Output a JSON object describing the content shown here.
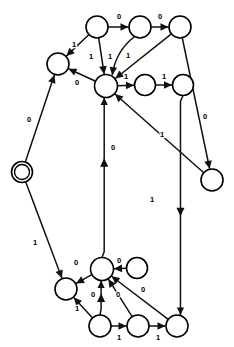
{
  "diagram": {
    "width": 234,
    "height": 347,
    "background_color": "#ffffff",
    "stroke_color": "#111111",
    "label_color": "#000000",
    "node_fill": "#ffffff",
    "nodes": [
      {
        "id": "n0",
        "name": "start-accept-state",
        "cx": 22,
        "cy": 172,
        "r": 10.5,
        "double": true
      },
      {
        "id": "n1",
        "name": "state-upper-left",
        "cx": 58,
        "cy": 64,
        "r": 11,
        "double": false
      },
      {
        "id": "n2",
        "name": "state-top-a",
        "cx": 97,
        "cy": 27,
        "r": 11,
        "double": false
      },
      {
        "id": "n3",
        "name": "state-top-b",
        "cx": 140,
        "cy": 27,
        "r": 11,
        "double": false
      },
      {
        "id": "n4",
        "name": "state-top-c",
        "cx": 180,
        "cy": 27,
        "r": 11,
        "double": false
      },
      {
        "id": "n5",
        "name": "state-hub",
        "cx": 106,
        "cy": 86,
        "r": 11.5,
        "double": false
      },
      {
        "id": "n6",
        "name": "state-mid-right-a",
        "cx": 145,
        "cy": 85,
        "r": 10.5,
        "double": false
      },
      {
        "id": "n7",
        "name": "state-mid-right-b",
        "cx": 183,
        "cy": 85,
        "r": 10.5,
        "double": false
      },
      {
        "id": "n8",
        "name": "state-right-low",
        "cx": 212,
        "cy": 180,
        "r": 11,
        "double": false
      },
      {
        "id": "n9",
        "name": "state-lower-left",
        "cx": 66,
        "cy": 289,
        "r": 11,
        "double": false
      },
      {
        "id": "n10",
        "name": "state-lower-hub",
        "cx": 102,
        "cy": 269,
        "r": 11.5,
        "double": false
      },
      {
        "id": "n11",
        "name": "state-lower-top-r",
        "cx": 137,
        "cy": 268,
        "r": 10.5,
        "double": false
      },
      {
        "id": "n12",
        "name": "state-bottom-a",
        "cx": 100,
        "cy": 326,
        "r": 11,
        "double": false
      },
      {
        "id": "n13",
        "name": "state-bottom-b",
        "cx": 138,
        "cy": 326,
        "r": 11,
        "double": false
      },
      {
        "id": "n14",
        "name": "state-bottom-c",
        "cx": 177,
        "cy": 326,
        "r": 11,
        "double": false
      }
    ],
    "edges": [
      {
        "name": "edge-start-to-upper-left",
        "from": "n0",
        "to": "n1",
        "label": "0",
        "lx": 29,
        "ly": 120,
        "kind": "straight"
      },
      {
        "name": "edge-upper-left-to-top-a-rev",
        "from": "n2",
        "to": "n1",
        "label": "1",
        "lx": 74,
        "ly": 45,
        "kind": "straight"
      },
      {
        "name": "edge-hub-to-upper-left",
        "from": "n5",
        "to": "n1",
        "label": "0",
        "lx": 77,
        "ly": 83,
        "kind": "straight"
      },
      {
        "name": "edge-top-a-to-top-b",
        "from": "n2",
        "to": "n3",
        "label": "0",
        "lx": 119,
        "ly": 17,
        "kind": "straight"
      },
      {
        "name": "edge-top-b-to-top-c",
        "from": "n3",
        "to": "n4",
        "label": "0",
        "lx": 160,
        "ly": 17,
        "kind": "straight"
      },
      {
        "name": "edge-top-a-to-hub",
        "from": "n2",
        "to": "n5",
        "label": "1",
        "lx": 91,
        "ly": 57,
        "kind": "straight"
      },
      {
        "name": "edge-top-b-to-hub",
        "from": "n3",
        "to": "n5",
        "label": "1",
        "lx": 110,
        "ly": 57,
        "kind": "curve"
      },
      {
        "name": "edge-top-c-to-hub",
        "from": "n4",
        "to": "n5",
        "label": "1",
        "lx": 128,
        "ly": 56,
        "kind": "straight"
      },
      {
        "name": "edge-hub-to-mid-right-a",
        "from": "n5",
        "to": "n6",
        "label": "1",
        "lx": 126,
        "ly": 77,
        "kind": "straight"
      },
      {
        "name": "edge-mid-right-a-to-b",
        "from": "n6",
        "to": "n7",
        "label": "1",
        "lx": 164,
        "ly": 77,
        "kind": "straight"
      },
      {
        "name": "edge-top-c-to-right-low",
        "from": "n4",
        "to": "n8",
        "label": "0",
        "lx": 205,
        "ly": 117,
        "kind": "straight"
      },
      {
        "name": "edge-right-low-to-hub",
        "from": "n8",
        "to": "n5",
        "label": "1",
        "lx": 162,
        "ly": 135,
        "kind": "straight"
      },
      {
        "name": "edge-lower-hub-up-to-hub",
        "from": "n10",
        "to": "n5",
        "label": "0",
        "lx": 113,
        "ly": 148,
        "kind": "vertical-up"
      },
      {
        "name": "edge-mid-right-b-down-to-bottom-c",
        "from": "n7",
        "to": "n14",
        "label": "1",
        "lx": 152,
        "ly": 200,
        "kind": "vertical-down"
      },
      {
        "name": "edge-start-to-lower-left",
        "from": "n0",
        "to": "n9",
        "label": "1",
        "lx": 35,
        "ly": 243,
        "kind": "straight"
      },
      {
        "name": "edge-lower-hub-to-lower-left",
        "from": "n10",
        "to": "n9",
        "label": "0",
        "lx": 76,
        "ly": 263,
        "kind": "straight"
      },
      {
        "name": "edge-lower-top-r-to-lower-hub",
        "from": "n11",
        "to": "n10",
        "label": "0",
        "lx": 119,
        "ly": 261,
        "kind": "straight"
      },
      {
        "name": "edge-bottom-a-to-lower-hub",
        "from": "n12",
        "to": "n10",
        "label": "0",
        "lx": 93,
        "ly": 295,
        "kind": "vertical-up"
      },
      {
        "name": "edge-bottom-b-to-lower-hub",
        "from": "n13",
        "to": "n10",
        "label": "0",
        "lx": 118,
        "ly": 295,
        "kind": "straight"
      },
      {
        "name": "edge-bottom-c-to-lower-hub",
        "from": "n14",
        "to": "n10",
        "label": "0",
        "lx": 143,
        "ly": 290,
        "kind": "straight"
      },
      {
        "name": "edge-bottom-a-to-lower-left",
        "from": "n12",
        "to": "n9",
        "label": "1",
        "lx": 77,
        "ly": 309,
        "kind": "straight"
      },
      {
        "name": "edge-bottom-a-to-bottom-b",
        "from": "n12",
        "to": "n13",
        "label": "1",
        "lx": 119,
        "ly": 338,
        "kind": "straight"
      },
      {
        "name": "edge-bottom-b-to-bottom-c",
        "from": "n13",
        "to": "n14",
        "label": "1",
        "lx": 158,
        "ly": 338,
        "kind": "straight"
      }
    ],
    "alphabet": [
      "0",
      "1"
    ]
  }
}
